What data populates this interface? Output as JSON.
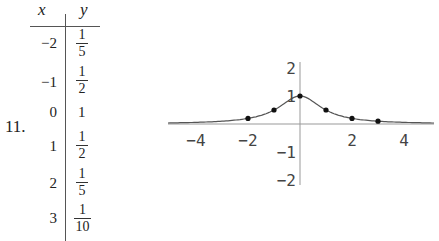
{
  "problem_number": "11.",
  "table": {
    "headers": [
      "x",
      "y"
    ],
    "rows": [
      {
        "x": "−2",
        "y_num": "1",
        "y_den": "5"
      },
      {
        "x": "−1",
        "y_num": "1",
        "y_den": "2"
      },
      {
        "x": "0",
        "y": "1"
      },
      {
        "x": "1",
        "y_num": "1",
        "y_den": "2"
      },
      {
        "x": "2",
        "y_num": "1",
        "y_den": "5"
      },
      {
        "x": "3",
        "y_num": "1",
        "y_den": "10"
      }
    ]
  },
  "chart_data": {
    "type": "scatter",
    "title": "",
    "xlabel": "",
    "ylabel": "",
    "xlim": [
      -5.3,
      5.3
    ],
    "ylim": [
      -2.2,
      2.2
    ],
    "x_ticks": [
      "-4",
      "-2",
      "2",
      "4"
    ],
    "y_ticks": [
      "2",
      "1",
      "-1",
      "-2"
    ],
    "grid": false,
    "series": [
      {
        "name": "data points",
        "type": "scatter",
        "x": [
          -2,
          -1,
          0,
          1,
          2,
          3
        ],
        "y": [
          0.2,
          0.5,
          1,
          0.5,
          0.2,
          0.1
        ]
      },
      {
        "name": "fitted curve",
        "type": "line",
        "function": "y = 1/(1+x^2)"
      }
    ]
  }
}
